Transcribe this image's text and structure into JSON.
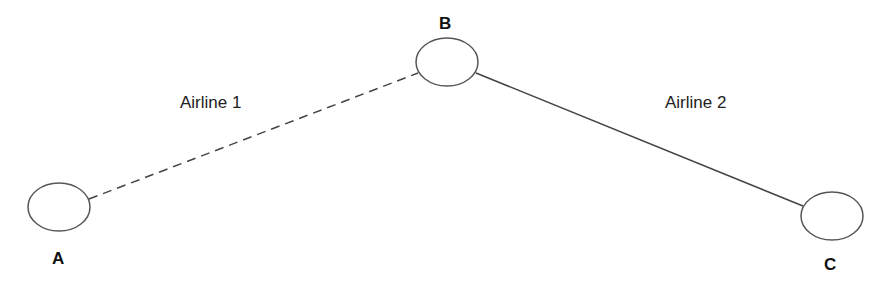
{
  "diagram": {
    "nodes": [
      {
        "id": "A",
        "label": "A"
      },
      {
        "id": "B",
        "label": "B"
      },
      {
        "id": "C",
        "label": "C"
      }
    ],
    "edges": [
      {
        "from": "A",
        "to": "B",
        "label": "Airline 1",
        "style": "dashed"
      },
      {
        "from": "B",
        "to": "C",
        "label": "Airline 2",
        "style": "solid"
      }
    ],
    "colors": {
      "stroke": "#444444",
      "text": "#111111",
      "background": "#ffffff"
    }
  }
}
